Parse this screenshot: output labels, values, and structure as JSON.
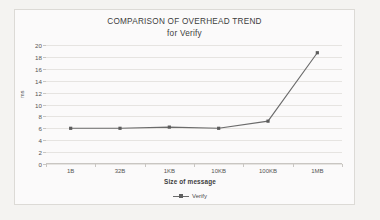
{
  "chart_data": {
    "type": "line",
    "title": "COMPARISON OF OVERHEAD TREND",
    "subtitle": "for Verify",
    "xlabel": "Size of message",
    "ylabel": "ms",
    "categories": [
      "1B",
      "32B",
      "1KB",
      "10KB",
      "100KB",
      "1MB"
    ],
    "series": [
      {
        "name": "Verify",
        "values": [
          6.0,
          6.0,
          6.2,
          6.0,
          7.2,
          18.7
        ]
      }
    ],
    "ylim": [
      0,
      20
    ],
    "ytick_step": 2,
    "yticks": [
      "20",
      "18",
      "16",
      "14",
      "12",
      "10",
      "8",
      "6",
      "4",
      "2",
      "0"
    ],
    "grid": true,
    "legend_position": "bottom",
    "line_color": "#6b6b6b",
    "marker_color": "#5c5c5c",
    "plot_background": "#fbfafa",
    "grid_color": "#e6e4e1"
  },
  "legend": {
    "entries": [
      {
        "label": "Verify"
      }
    ]
  }
}
